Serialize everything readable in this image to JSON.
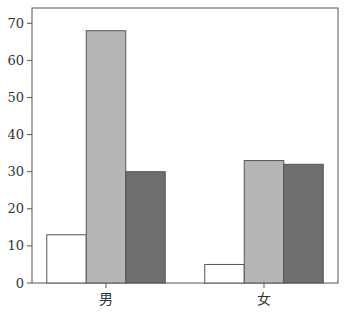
{
  "chart_data": {
    "type": "bar",
    "title": "",
    "xlabel": "",
    "ylabel": "",
    "categories": [
      "男",
      "女"
    ],
    "series": [
      {
        "name": "series-1",
        "color": "#ffffff",
        "values": [
          13,
          5
        ]
      },
      {
        "name": "series-2",
        "color": "#b5b5b5",
        "values": [
          68,
          33
        ]
      },
      {
        "name": "series-3",
        "color": "#6e6e6e",
        "values": [
          30,
          32
        ]
      }
    ],
    "ylim": [
      0,
      74
    ],
    "yticks": [
      0,
      10,
      20,
      30,
      40,
      50,
      60,
      70
    ],
    "grid": false,
    "legend": "none"
  }
}
